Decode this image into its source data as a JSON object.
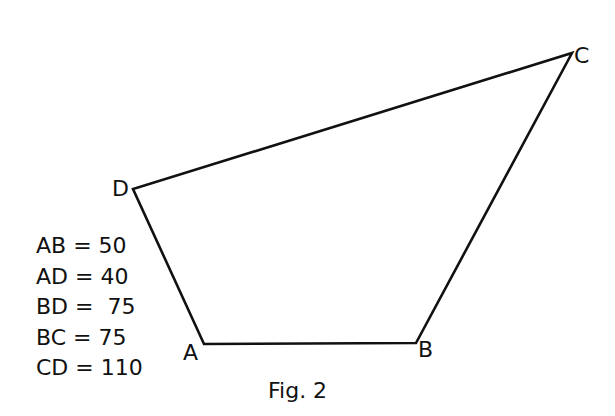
{
  "figure": {
    "caption": "Fig. 2",
    "vertices": {
      "A": {
        "label": "A",
        "x": 204,
        "y": 344
      },
      "B": {
        "label": "B",
        "x": 416,
        "y": 343
      },
      "C": {
        "label": "C",
        "x": 572,
        "y": 53
      },
      "D": {
        "label": "D",
        "x": 133,
        "y": 189
      }
    },
    "edges": [
      "AB",
      "BC",
      "CD",
      "DA"
    ],
    "line_color": "#111111"
  },
  "measurements": [
    {
      "segment": "AB",
      "text": "AB = 50"
    },
    {
      "segment": "AD",
      "text": "AD = 40"
    },
    {
      "segment": "BD",
      "text": "BD =  75"
    },
    {
      "segment": "BC",
      "text": "BC = 75"
    },
    {
      "segment": "CD",
      "text": "CD = 110"
    }
  ]
}
